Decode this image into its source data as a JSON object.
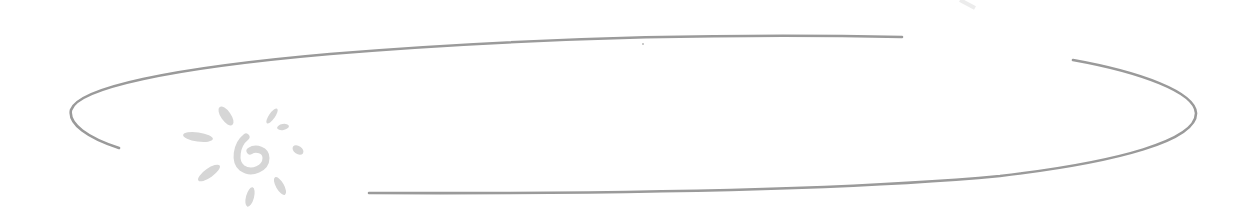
{
  "graphic": {
    "description": "Decorative open ellipse outline with a hand-drawn sun logo",
    "colors": {
      "background": "#ffffff",
      "ellipse_stroke": "#9a9a9a",
      "sun_fill": "#d6d6d6"
    },
    "ellipse": {
      "center": [
        633,
        113
      ],
      "rx": 563,
      "ry": 80,
      "stroke_width": 2.6
    },
    "sun_logo": {
      "center": [
        229,
        158
      ],
      "glyph": "G"
    }
  }
}
